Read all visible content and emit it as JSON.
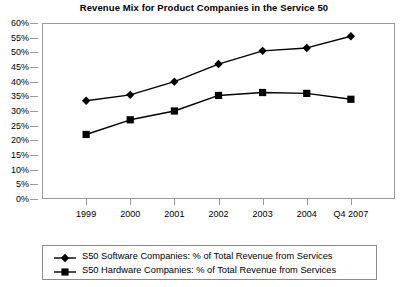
{
  "chart_data": {
    "type": "line",
    "title": "Revenue Mix for Product Companies in the Service 50",
    "xlabel": "",
    "ylabel": "",
    "categories": [
      "1999",
      "2000",
      "2001",
      "2002",
      "2003",
      "2004",
      "Q4 2007"
    ],
    "ylim": [
      0,
      60
    ],
    "ytick_step": 5,
    "ytick_labels": [
      "60%",
      "55%",
      "50%",
      "45%",
      "40%",
      "35%",
      "30%",
      "25%",
      "20%",
      "15%",
      "10%",
      "5%",
      "0%"
    ],
    "ytick_values": [
      60,
      55,
      50,
      45,
      40,
      35,
      30,
      25,
      20,
      15,
      10,
      5,
      0
    ],
    "grid": false,
    "legend_position": "bottom",
    "series": [
      {
        "name": "S50 Software Companies: % of Total Revenue from Services",
        "marker": "diamond",
        "color": "#000000",
        "values": [
          33.5,
          35.5,
          40.0,
          46.0,
          50.5,
          51.5,
          55.5
        ]
      },
      {
        "name": "S50 Hardware Companies: % of Total Revenue from Services",
        "marker": "square",
        "color": "#000000",
        "values": [
          22.0,
          27.0,
          30.0,
          35.3,
          36.3,
          36.0,
          34.0
        ]
      }
    ]
  },
  "legend": {
    "entries": [
      {
        "label": "S50 Software Companies: % of Total Revenue from Services",
        "marker": "diamond"
      },
      {
        "label": "S50 Hardware Companies: % of Total Revenue from Services",
        "marker": "square"
      }
    ]
  },
  "colors": {
    "series": "#000000",
    "axis": "#9a9a9a",
    "legend_border": "#8c8c8c",
    "background": "#ffffff",
    "text": "#000000"
  }
}
